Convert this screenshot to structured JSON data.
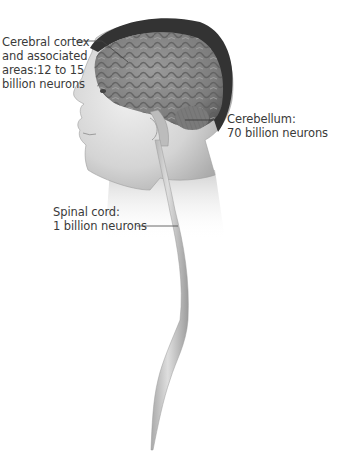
{
  "figure": {
    "labels": [
      {
        "id": "cerebral-cortex",
        "lines": [
          "Cerebral cortex",
          "and associated",
          "areas:12 to 15",
          "billion neurons"
        ]
      },
      {
        "id": "cerebellum",
        "lines": [
          "Cerebellum:",
          "70 billion neurons"
        ]
      },
      {
        "id": "spinal-cord",
        "lines": [
          "Spinal cord:",
          "1 billion neurons"
        ]
      }
    ],
    "colors": {
      "background": "#ffffff",
      "label_text": "#3a3a3a",
      "leader_line": "#444444",
      "skin": "#d9d9d9",
      "brain": "#8a8a8a",
      "hair": "#333333",
      "spinal_cord": "#c4c4c4"
    }
  }
}
